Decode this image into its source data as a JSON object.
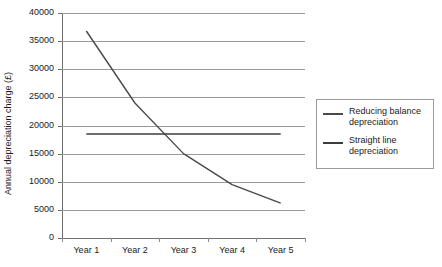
{
  "chart_data": {
    "type": "line",
    "title": "",
    "xlabel": "",
    "ylabel": "Annual depreciation charge (£)",
    "categories": [
      "Year 1",
      "Year 2",
      "Year 3",
      "Year 4",
      "Year 5"
    ],
    "ylim": [
      0,
      40000
    ],
    "yticks": [
      "0",
      "5000",
      "10000",
      "15000",
      "20000",
      "25000",
      "30000",
      "35000",
      "40000"
    ],
    "ytick_values": [
      0,
      5000,
      10000,
      15000,
      20000,
      25000,
      30000,
      35000,
      40000
    ],
    "grid": true,
    "legend_position": "right",
    "series": [
      {
        "name": "Reducing balance depreciation",
        "values": [
          36800,
          24000,
          15000,
          9500,
          6200
        ],
        "color": "#4a4a4a"
      },
      {
        "name": "Straight line depreciation",
        "values": [
          18500,
          18500,
          18500,
          18500,
          18500
        ],
        "color": "#3c3c3c"
      }
    ]
  },
  "legend": {
    "items": [
      {
        "label_line1": "Reducing balance",
        "label_line2": "depreciation"
      },
      {
        "label_line1": "Straight line",
        "label_line2": "depreciation"
      }
    ]
  },
  "colors": {
    "gridline": "#9a9a9a",
    "axis": "#6f6f6f",
    "text": "#1a1a1a",
    "background": "#ffffff",
    "legend_border": "#9b9b9b"
  }
}
